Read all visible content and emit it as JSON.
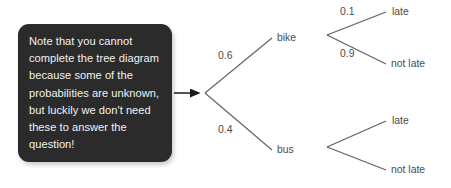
{
  "diagram": {
    "type": "probability-tree"
  },
  "callout": {
    "text": "Note that you cannot complete the tree diagram because some of the probabilities are unknown, but luckily we don't need these to answer the question!",
    "background_color": "#2b2b2b",
    "text_color": "#f2f2f2"
  },
  "tree": {
    "root": {
      "x": 205,
      "y": 93
    },
    "level1": [
      {
        "label": "bike",
        "probability": "0.6",
        "node_x": 272,
        "node_y": 38,
        "label_x": 277,
        "label_y": 41,
        "prob_x": 218,
        "prob_y": 59
      },
      {
        "label": "bus",
        "probability": "0.4",
        "node_x": 272,
        "node_y": 150,
        "label_x": 277,
        "label_y": 153,
        "prob_x": 218,
        "prob_y": 133
      }
    ],
    "level2": [
      {
        "parent": "bike",
        "node_x": 327,
        "node_y": 35,
        "outcomes": [
          {
            "label": "late",
            "probability": "0.1",
            "end_x": 386,
            "end_y": 12,
            "label_x": 392,
            "label_y": 15,
            "prob_x": 340,
            "prob_y": 15
          },
          {
            "label": "not late",
            "probability": "0.9",
            "end_x": 386,
            "end_y": 64,
            "label_x": 391,
            "label_y": 67,
            "prob_x": 340,
            "prob_y": 57
          }
        ]
      },
      {
        "parent": "bus",
        "node_x": 327,
        "node_y": 147,
        "outcomes": [
          {
            "label": "late",
            "probability": "",
            "end_x": 386,
            "end_y": 121,
            "label_x": 392,
            "label_y": 124,
            "prob_x": 340,
            "prob_y": 124
          },
          {
            "label": "not late",
            "probability": "",
            "end_x": 386,
            "end_y": 170,
            "label_x": 391,
            "label_y": 173,
            "prob_x": 340,
            "prob_y": 166
          }
        ]
      }
    ],
    "arrow": {
      "start_x": 174,
      "start_y": 93,
      "end_x": 201,
      "end_y": 93
    },
    "branch_color": "#5d5d5d",
    "label_color": "#4a4a4a",
    "arrow_color": "#1a1a1a"
  }
}
